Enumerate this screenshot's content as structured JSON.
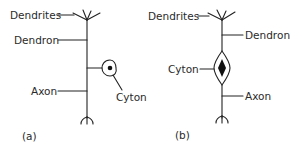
{
  "figure": {
    "panels": [
      {
        "id": "a",
        "caption": "(a)",
        "labels": {
          "dendrites": "Dendrites",
          "dendron": "Dendron",
          "cyton": "Cyton",
          "axon": "Axon"
        },
        "type": "unipolar-neuron"
      },
      {
        "id": "b",
        "caption": "(b)",
        "labels": {
          "dendrites": "Dendrites",
          "dendron": "Dendron",
          "cyton": "Cyton",
          "axon": "Axon"
        },
        "type": "bipolar-neuron"
      }
    ],
    "colors": {
      "line": "#222222",
      "text": "#2a2a2a",
      "background": "#ffffff"
    }
  }
}
